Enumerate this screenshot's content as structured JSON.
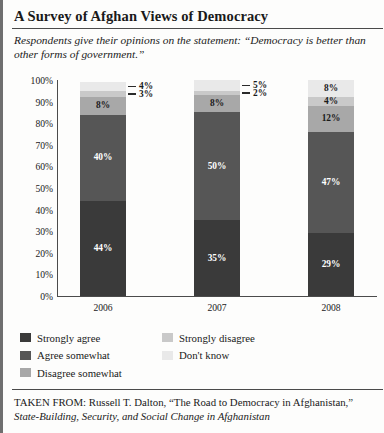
{
  "header": {
    "title": "A Survey of Afghan Views of Democracy",
    "subtitle": "Respondents give their opinions on the statement: “Democracy is better than other forms of government.”"
  },
  "source": {
    "prefix": "TAKEN FROM: Russell T. Dalton, “The Road to Democracy in Afghanistan,” ",
    "italic": "State-Building, Security, and Social Change in Afghanistan"
  },
  "legend": {
    "left": [
      {
        "label": "Strongly agree",
        "color": "#3a3a3a"
      },
      {
        "label": "Agree somewhat",
        "color": "#565656"
      },
      {
        "label": "Disagree somewhat",
        "color": "#a8a8a8"
      }
    ],
    "right": [
      {
        "label": "Strongly disagree",
        "color": "#c9c9c9"
      },
      {
        "label": "Don't know",
        "color": "#e9e9e9"
      }
    ]
  },
  "chart_data": {
    "type": "bar",
    "subtype": "stacked-column-100",
    "title": "A Survey of Afghan Views of Democracy",
    "subtitle": "Respondents give their opinions on the statement: “Democracy is better than other forms of government.”",
    "xlabel": "",
    "ylabel": "",
    "ylim": [
      0,
      100
    ],
    "ytick_labels": [
      "100%",
      "90%",
      "80%",
      "70%",
      "60%",
      "50%",
      "40%",
      "30%",
      "20%",
      "10%",
      "0%"
    ],
    "ytick_values": [
      100,
      90,
      80,
      70,
      60,
      50,
      40,
      30,
      20,
      10,
      0
    ],
    "grid": false,
    "legend_position": "bottom",
    "categories": [
      "2006",
      "2007",
      "2008"
    ],
    "series": [
      {
        "name": "Strongly agree",
        "color": "#3a3a3a",
        "values": [
          44,
          35,
          29
        ],
        "labels": [
          "44%",
          "35%",
          "29%"
        ]
      },
      {
        "name": "Agree somewhat",
        "color": "#565656",
        "values": [
          40,
          50,
          47
        ],
        "labels": [
          "40%",
          "50%",
          "47%"
        ]
      },
      {
        "name": "Disagree somewhat",
        "color": "#a8a8a8",
        "values": [
          8,
          8,
          12
        ],
        "labels": [
          "8%",
          "8%",
          "12%"
        ]
      },
      {
        "name": "Strongly disagree",
        "color": "#c9c9c9",
        "values": [
          3,
          2,
          4
        ],
        "labels": [
          "3%",
          "2%",
          "4%"
        ]
      },
      {
        "name": "Don't know",
        "color": "#e9e9e9",
        "values": [
          4,
          5,
          8
        ],
        "labels": [
          "4%",
          "5%",
          "8%"
        ]
      }
    ]
  }
}
